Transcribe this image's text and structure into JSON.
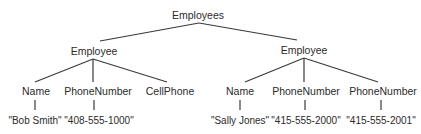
{
  "diagram": {
    "type": "tree",
    "line_color": "#3a3a3a",
    "text_color": "#2b2b2b",
    "nodes": [
      {
        "id": "root",
        "label": "Employees",
        "x": 198,
        "y": 15
      },
      {
        "id": "emp1",
        "label": "Employee",
        "x": 94,
        "y": 51
      },
      {
        "id": "emp2",
        "label": "Employee",
        "x": 304,
        "y": 50
      },
      {
        "id": "emp1_name",
        "label": "Name",
        "x": 36,
        "y": 91
      },
      {
        "id": "emp1_phone",
        "label": "PhoneNumber",
        "x": 98,
        "y": 91
      },
      {
        "id": "emp1_cell",
        "label": "CellPhone",
        "x": 170,
        "y": 91
      },
      {
        "id": "emp2_name",
        "label": "Name",
        "x": 240,
        "y": 91
      },
      {
        "id": "emp2_phone1",
        "label": "PhoneNumber",
        "x": 306,
        "y": 91
      },
      {
        "id": "emp2_phone2",
        "label": "PhoneNumber",
        "x": 383,
        "y": 91
      },
      {
        "id": "emp1_name_val",
        "label": "\"Bob Smith\"",
        "x": 35,
        "y": 121
      },
      {
        "id": "emp1_phone_val",
        "label": "\"408-555-1000\"",
        "x": 99,
        "y": 121
      },
      {
        "id": "emp2_name_val",
        "label": "\"Sally Jones\"",
        "x": 240,
        "y": 121
      },
      {
        "id": "emp2_phone1_val",
        "label": "\"415-555-2000\"",
        "x": 306,
        "y": 121
      },
      {
        "id": "emp2_phone2_val",
        "label": "\"415-555-2001\"",
        "x": 381,
        "y": 121
      }
    ],
    "edges": [
      {
        "from": "root",
        "to": "emp1",
        "x1": 199,
        "y1": 23,
        "x2": 100,
        "y2": 41
      },
      {
        "from": "root",
        "to": "emp2",
        "x1": 199,
        "y1": 23,
        "x2": 297,
        "y2": 40
      },
      {
        "from": "emp1",
        "to": "emp1_name",
        "x1": 93,
        "y1": 59,
        "x2": 35,
        "y2": 82
      },
      {
        "from": "emp1",
        "to": "emp1_phone",
        "x1": 93,
        "y1": 59,
        "x2": 93,
        "y2": 82
      },
      {
        "from": "emp1",
        "to": "emp1_cell",
        "x1": 93,
        "y1": 59,
        "x2": 167,
        "y2": 82
      },
      {
        "from": "emp2",
        "to": "emp2_name",
        "x1": 304,
        "y1": 58,
        "x2": 245,
        "y2": 82
      },
      {
        "from": "emp2",
        "to": "emp2_phone1",
        "x1": 304,
        "y1": 58,
        "x2": 304,
        "y2": 82
      },
      {
        "from": "emp2",
        "to": "emp2_phone2",
        "x1": 304,
        "y1": 58,
        "x2": 378,
        "y2": 82
      },
      {
        "from": "emp1_name",
        "to": "emp1_name_val",
        "x1": 35,
        "y1": 100,
        "x2": 35,
        "y2": 110
      },
      {
        "from": "emp1_phone",
        "to": "emp1_phone_val",
        "x1": 94,
        "y1": 100,
        "x2": 94,
        "y2": 110
      },
      {
        "from": "emp2_name",
        "to": "emp2_name_val",
        "x1": 240,
        "y1": 100,
        "x2": 240,
        "y2": 110
      },
      {
        "from": "emp2_phone1",
        "to": "emp2_phone1_val",
        "x1": 305,
        "y1": 100,
        "x2": 305,
        "y2": 110
      },
      {
        "from": "emp2_phone2",
        "to": "emp2_phone2_val",
        "x1": 381,
        "y1": 100,
        "x2": 381,
        "y2": 110
      }
    ]
  }
}
